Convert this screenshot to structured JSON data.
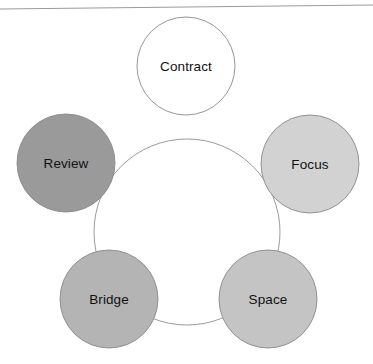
{
  "diagram": {
    "type": "cycle",
    "background_color": "#ffffff",
    "connector": {
      "name": "ring-connector",
      "color": "#9b9b9b",
      "stroke_width": 1,
      "center_x": 187,
      "center_y": 232,
      "radius": 93
    },
    "top_rule": {
      "name": "scan-edge-line",
      "color": "#9a9a9a",
      "x1": 0,
      "y1": 9,
      "x2": 373,
      "y2": 5
    },
    "node_radius": 49,
    "nodes": [
      {
        "id": "contract",
        "label": "Contract",
        "fill": "#ffffff",
        "stroke": "#8a8a8a",
        "text_color": "#111111",
        "cx": 186,
        "cy": 66,
        "r": 49
      },
      {
        "id": "focus",
        "label": "Focus",
        "fill": "#d2d2d2",
        "stroke": "#8a8a8a",
        "text_color": "#111111",
        "cx": 310,
        "cy": 164,
        "r": 49
      },
      {
        "id": "space",
        "label": "Space",
        "fill": "#c4c4c4",
        "stroke": "#8a8a8a",
        "text_color": "#111111",
        "cx": 268,
        "cy": 299,
        "r": 49
      },
      {
        "id": "bridge",
        "label": "Bridge",
        "fill": "#b4b4b4",
        "stroke": "#8a8a8a",
        "text_color": "#111111",
        "cx": 109,
        "cy": 299,
        "r": 49
      },
      {
        "id": "review",
        "label": "Review",
        "fill": "#9a9a9a",
        "stroke": "#8a8a8a",
        "text_color": "#111111",
        "cx": 66,
        "cy": 163,
        "r": 49
      }
    ]
  }
}
